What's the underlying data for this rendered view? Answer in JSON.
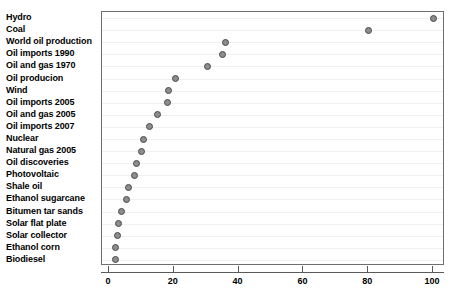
{
  "chart_data": {
    "type": "scatter",
    "title": "",
    "subtitle": "",
    "xlabel": "",
    "ylabel": "",
    "orientation": "horizontal",
    "grid": true,
    "legend": false,
    "xlim": [
      -3,
      105
    ],
    "xticks": [
      0,
      20,
      40,
      60,
      80,
      100
    ],
    "xtick_labels": [
      "0",
      "20",
      "40",
      "60",
      "80",
      "100"
    ],
    "categories": [
      "Hydro",
      "Coal",
      "World oil production",
      "Oil imports 1990",
      "Oil and gas 1970",
      "Oil producion",
      "Wind",
      "Oil imports 2005",
      "Oil and gas 2005",
      "Oil imports 2007",
      "Nuclear",
      "Natural gas 2005",
      "Oil discoveries",
      "Photovoltaic",
      "Shale oil",
      "Ethanol sugarcane",
      "Bitumen tar sands",
      "Solar flat plate",
      "Solar collector",
      "Ethanol corn",
      "Biodiesel"
    ],
    "values": [
      100,
      80,
      36,
      35,
      30.5,
      20.5,
      18.5,
      18,
      15,
      12.5,
      10.5,
      10,
      8.5,
      8,
      6,
      5.5,
      4,
      3,
      2.5,
      2,
      2
    ],
    "marker": {
      "shape": "circle",
      "fill_color": "#8d8d8d",
      "edge_color": "#4a4a4a",
      "size_px": 7
    },
    "colors": {
      "background": "#ffffff",
      "frame": "#6e6e6e",
      "gridline": "#f0f0f0",
      "axis": "#5a5a5a",
      "text": "#000000"
    }
  }
}
